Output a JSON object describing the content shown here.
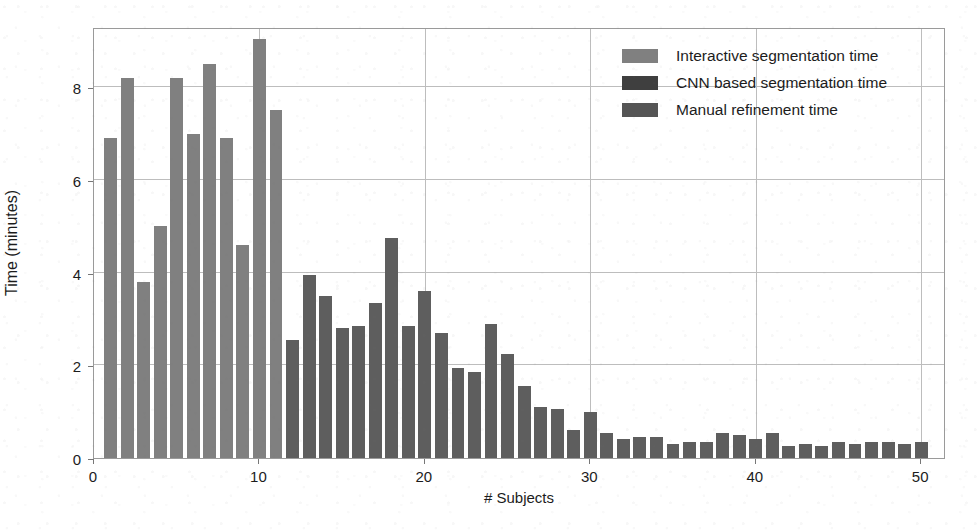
{
  "chart_data": {
    "type": "bar",
    "title": "",
    "xlabel": "# Subjects",
    "ylabel": "Time (minutes)",
    "xlim": [
      0,
      51.5
    ],
    "ylim": [
      0,
      9.3
    ],
    "xticks": [
      0,
      10,
      20,
      30,
      40,
      50
    ],
    "xtick_labels": [
      "0",
      "10",
      "20",
      "30",
      "40",
      "50"
    ],
    "yticks": [
      0,
      2,
      4,
      6,
      8
    ],
    "ytick_labels": [
      "0",
      "2",
      "4",
      "6",
      "8"
    ],
    "grid": true,
    "legend_position": "upper right",
    "colors": {
      "interactive": "#808080",
      "cnn": "#4d4d4d",
      "manual": "#5e5e5e"
    },
    "legend": [
      {
        "label": "Interactive segmentation time",
        "color": "#808080",
        "key": "interactive"
      },
      {
        "label": "CNN based segmentation time",
        "color": "#3f3f3f",
        "key": "cnn"
      },
      {
        "label": "Manual refinement time",
        "color": "#555555",
        "key": "manual"
      }
    ],
    "series": [
      {
        "name": "Interactive segmentation time",
        "color": "#808080",
        "x": [
          1,
          2,
          3,
          4,
          5,
          6,
          7,
          8,
          9,
          10,
          11
        ],
        "values": [
          6.9,
          8.2,
          3.8,
          5.0,
          8.2,
          7.0,
          8.5,
          6.9,
          4.6,
          9.05,
          7.5
        ]
      },
      {
        "name": "Manual refinement time",
        "color": "#5e5e5e",
        "x": [
          12,
          13,
          14,
          15,
          16,
          17,
          18,
          19,
          20,
          21,
          22,
          23,
          24,
          25,
          26,
          27,
          28,
          29,
          30,
          31,
          32,
          33,
          34,
          35,
          36,
          37,
          38,
          39,
          40,
          41,
          42,
          43,
          44,
          45,
          46,
          47,
          48,
          49,
          50
        ],
        "values": [
          2.55,
          3.95,
          3.5,
          2.8,
          2.85,
          3.35,
          4.75,
          2.85,
          3.6,
          2.7,
          1.95,
          1.85,
          2.9,
          2.25,
          1.55,
          1.1,
          1.05,
          0.6,
          1.0,
          0.55,
          0.4,
          0.45,
          0.45,
          0.3,
          0.35,
          0.35,
          0.55,
          0.5,
          0.4,
          0.55,
          0.25,
          0.3,
          0.25,
          0.35,
          0.3,
          0.35,
          0.35,
          0.3,
          0.35
        ]
      }
    ]
  }
}
